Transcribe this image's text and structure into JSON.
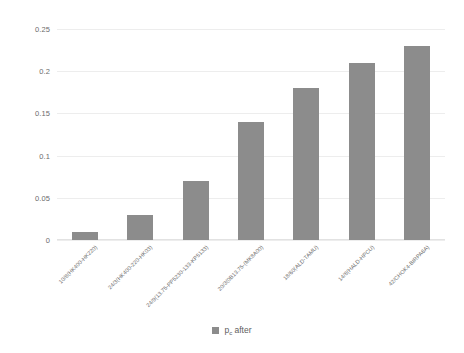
{
  "chart_data": {
    "type": "bar",
    "title": "",
    "xlabel": "",
    "ylabel": "",
    "ylim": [
      0,
      0.25
    ],
    "yticks": [
      "0",
      "0.05",
      "0.1",
      "0.15",
      "0.2",
      "0.25"
    ],
    "ytick_values": [
      0,
      0.05,
      0.1,
      0.15,
      0.2,
      0.25
    ],
    "grid": true,
    "legend_position": "bottom",
    "categories": [
      "10/8(HK400-HK220)",
      "24/3(HK400-220-HK03)",
      "24/9(13.75-PP5230-133-KP5133)",
      "20/3(0B13.75-(MK8A00)",
      "18/60(ALD-TAMU)",
      "14/8(HALD-HPCU)",
      "42/CHOK4-BIRPA6A)"
    ],
    "series": [
      {
        "name": "p_c after",
        "values": [
          0.01,
          0.03,
          0.07,
          0.14,
          0.18,
          0.21,
          0.23
        ]
      }
    ],
    "colors": {
      "bar": "#8c8c8c",
      "gridline": "#ededed",
      "tick_text": "#6b6b6b",
      "background": "#ffffff"
    }
  },
  "legend": {
    "symbol": "p",
    "subscript": "c",
    "suffix": " after"
  }
}
